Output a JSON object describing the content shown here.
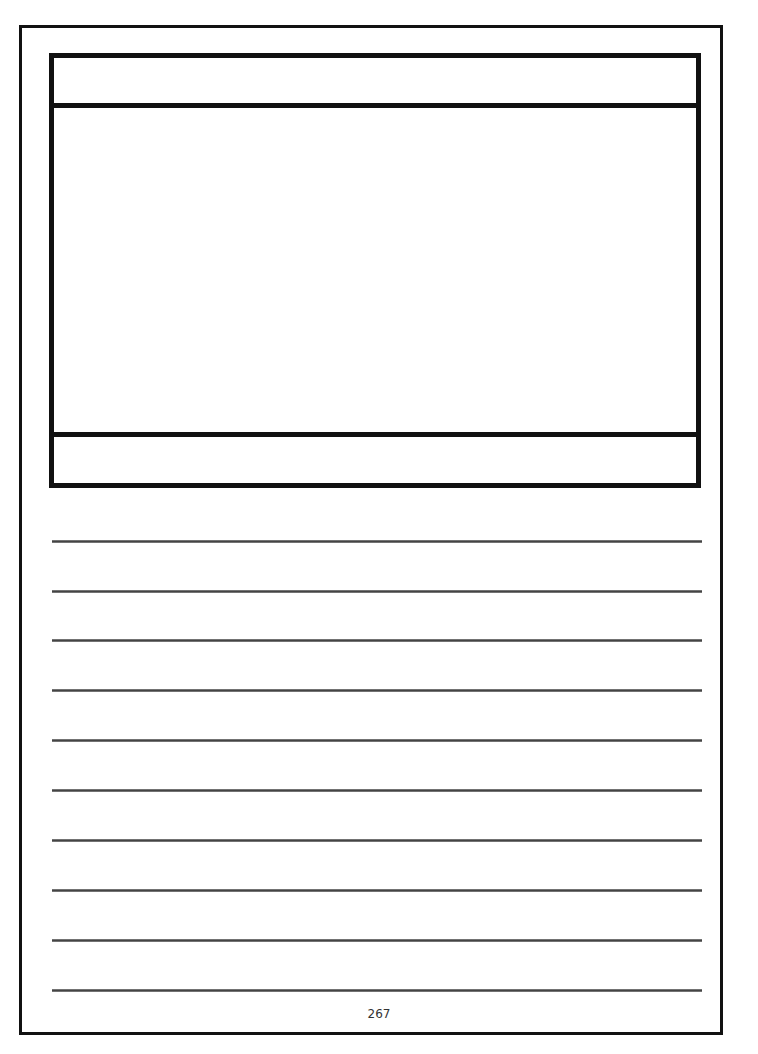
{
  "page": {
    "number": "267",
    "writing_lines": 10,
    "frame": {
      "sections": [
        "title-band",
        "drawing-area",
        "caption-band"
      ]
    }
  }
}
